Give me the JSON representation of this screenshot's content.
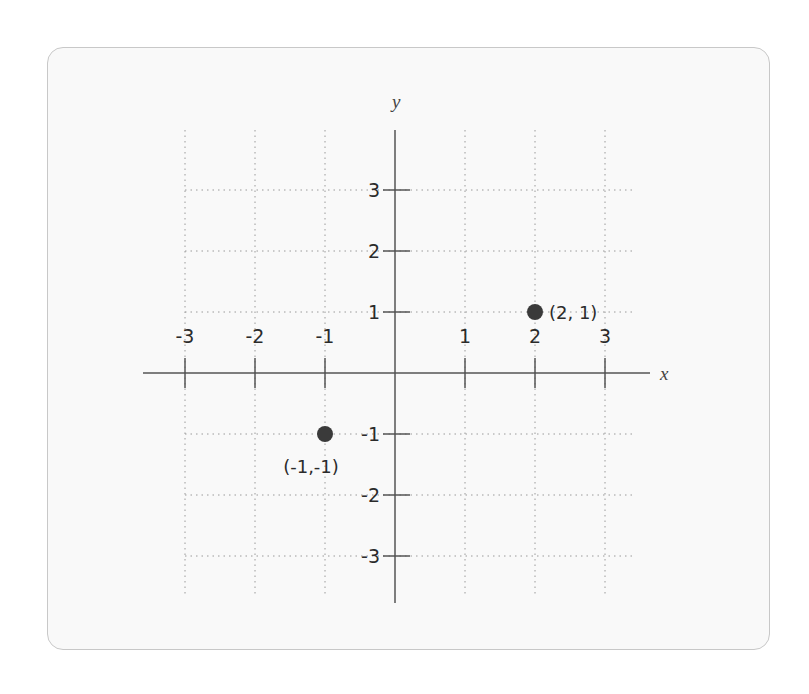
{
  "chart_data": {
    "type": "scatter",
    "title": "",
    "xlabel": "x",
    "ylabel": "y",
    "xlim": [
      -3,
      3
    ],
    "ylim": [
      -3,
      3
    ],
    "grid": true,
    "grid_style": "dotted",
    "x_ticks": [
      -3,
      -2,
      -1,
      1,
      2,
      3
    ],
    "y_ticks": [
      3,
      2,
      1,
      -1,
      -2,
      -3
    ],
    "x_tick_labels": [
      "-3",
      "-2",
      "-1",
      "1",
      "2",
      "3"
    ],
    "y_tick_labels": [
      "3",
      "2",
      "1",
      "-1",
      "-2",
      "-3"
    ],
    "points": [
      {
        "x": 2,
        "y": 1,
        "label": "(2, 1)"
      },
      {
        "x": -1,
        "y": -1,
        "label": "(-1,-1)"
      }
    ],
    "colors": {
      "axis": "#555555",
      "grid": "#9a9a9a",
      "point": "#3a3a3a",
      "card_bg": "#f9f9f9",
      "card_border": "#c8c8c8"
    }
  }
}
